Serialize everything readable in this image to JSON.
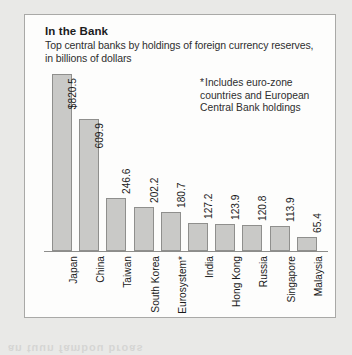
{
  "panel": {
    "title": "In the Bank",
    "subtitle": "Top central banks by holdings of foreign currency reserves, in billions of dollars",
    "footnote_marker": "*",
    "footnote": "Includes euro-zone countries and European Central Bank holdings"
  },
  "colors": {
    "page_background": "#e9e9e7",
    "panel_background": "#fdfdfc",
    "panel_border": "#a9a9a7",
    "bar_fill": "#c9c9c7",
    "bar_border": "#8f8f8d",
    "axis": "#8d8d8b",
    "text": "#1c1c1c"
  },
  "chart_data": {
    "type": "bar",
    "title": "In the Bank",
    "subtitle": "Top central banks by holdings of foreign currency reserves, in billions of dollars",
    "xlabel": "",
    "ylabel": "",
    "ylim": [
      0,
      860
    ],
    "grid": false,
    "legend": false,
    "orientation": "vertical",
    "units": "billions of dollars",
    "categories": [
      "Japan",
      "China",
      "Taiwan",
      "South Korea",
      "Eurosystem*",
      "India",
      "Hong Kong",
      "Russia",
      "Singapore",
      "Malaysia"
    ],
    "values": [
      820.5,
      609.9,
      246.6,
      202.2,
      180.7,
      127.2,
      123.9,
      120.8,
      113.9,
      65.4
    ],
    "value_labels": [
      "$820.5",
      "609.9",
      "246.6",
      "202.2",
      "180.7",
      "127.2",
      "123.9",
      "120.8",
      "113.9",
      "65.4"
    ],
    "annotations": [
      "*Includes euro-zone countries and European Central Bank holdings"
    ]
  },
  "bleed": "an tuun fambou broas"
}
